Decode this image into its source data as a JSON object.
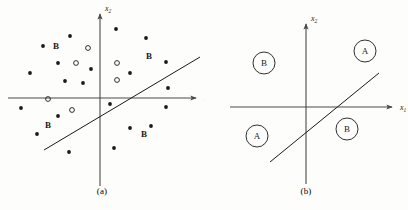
{
  "figure": {
    "panels": [
      {
        "id": "a",
        "caption": "(a)",
        "axes": {
          "x_label": "x",
          "x_sub": "1",
          "y_label": "x",
          "y_sub": "2",
          "origin_x": 100,
          "origin_y": 98,
          "x_axis_start": 8,
          "x_axis_end": 196,
          "y_axis_top": 14,
          "y_axis_bottom": 186
        },
        "boundary": {
          "x1": 44,
          "y1": 150,
          "x2": 200,
          "y2": 57,
          "label": "decision-boundary"
        },
        "class_text_labels": [
          {
            "text": "B",
            "x": 56,
            "y": 49
          },
          {
            "text": "B",
            "x": 149,
            "y": 59
          },
          {
            "text": "B",
            "x": 48,
            "y": 128
          },
          {
            "text": "B",
            "x": 144,
            "y": 137
          }
        ],
        "filled_points": [
          {
            "x": 70,
            "y": 36
          },
          {
            "x": 43,
            "y": 46
          },
          {
            "x": 116,
            "y": 29
          },
          {
            "x": 146,
            "y": 38
          },
          {
            "x": 58,
            "y": 63
          },
          {
            "x": 166,
            "y": 62
          },
          {
            "x": 91,
            "y": 69
          },
          {
            "x": 30,
            "y": 73
          },
          {
            "x": 130,
            "y": 73
          },
          {
            "x": 65,
            "y": 81
          },
          {
            "x": 83,
            "y": 83
          },
          {
            "x": 168,
            "y": 88
          },
          {
            "x": 21,
            "y": 108
          },
          {
            "x": 110,
            "y": 104
          },
          {
            "x": 166,
            "y": 107
          },
          {
            "x": 58,
            "y": 116
          },
          {
            "x": 37,
            "y": 134
          },
          {
            "x": 130,
            "y": 128
          },
          {
            "x": 151,
            "y": 126
          },
          {
            "x": 69,
            "y": 152
          },
          {
            "x": 114,
            "y": 148
          }
        ],
        "open_points": [
          {
            "x": 88,
            "y": 48
          },
          {
            "x": 76,
            "y": 63
          },
          {
            "x": 117,
            "y": 63
          },
          {
            "x": 117,
            "y": 80
          },
          {
            "x": 48,
            "y": 99
          },
          {
            "x": 72,
            "y": 110
          }
        ],
        "legend_note": {
          "filled": "class-B-sample",
          "open": "class-A-sample"
        }
      },
      {
        "id": "b",
        "caption": "(b)",
        "axes": {
          "x_label": "x",
          "x_sub": "1",
          "y_label": "x",
          "y_sub": "2",
          "origin_x": 102,
          "origin_y": 107,
          "x_axis_start": 26,
          "x_axis_end": 188,
          "y_axis_top": 24,
          "y_axis_bottom": 184
        },
        "boundary": {
          "x1": 66,
          "y1": 162,
          "x2": 175,
          "y2": 73,
          "label": "decision-boundary"
        },
        "region_labels": [
          {
            "text": "B",
            "x": 60,
            "y": 63,
            "r": 11,
            "quadrant": "upper-left"
          },
          {
            "text": "A",
            "x": 161,
            "y": 51,
            "r": 11,
            "quadrant": "upper-right"
          },
          {
            "text": "A",
            "x": 53,
            "y": 136,
            "r": 11,
            "quadrant": "lower-left"
          },
          {
            "text": "B",
            "x": 143,
            "y": 129,
            "r": 11,
            "quadrant": "lower-right"
          }
        ]
      }
    ]
  },
  "style": {
    "ink": "#1a1a1a",
    "axis_color": "#4a4a4a",
    "background": "#fdfdfb"
  }
}
